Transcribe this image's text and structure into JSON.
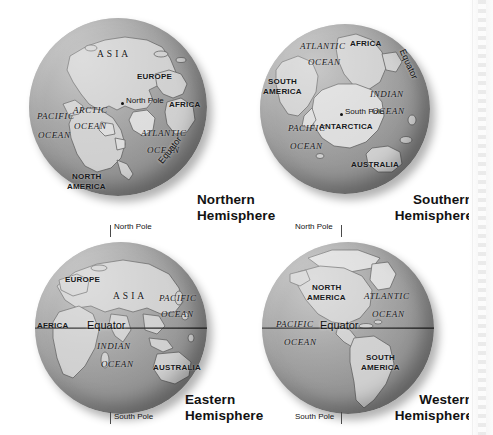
{
  "figure": {
    "background_color": "#ffffff",
    "ocean_color": "#949494",
    "land_color": "#cfcfcf",
    "line_color": "#1d1d1d",
    "panel_count": 4
  },
  "panels": [
    {
      "id": "northern",
      "caption_line1": "Northern",
      "caption_line2": "Hemisphere",
      "view": "north-polar",
      "pole_marker": {
        "label": "North Pole",
        "visible": true
      },
      "equator_label": "Equator",
      "labels": [
        {
          "text": "ASIA",
          "type": "continent-serif"
        },
        {
          "text": "EUROPE",
          "type": "continent"
        },
        {
          "text": "AFRICA",
          "type": "continent"
        },
        {
          "text": "NORTH",
          "type": "continent"
        },
        {
          "text": "AMERICA",
          "type": "continent"
        },
        {
          "text": "ARCTIC",
          "type": "ocean"
        },
        {
          "text": "OCEAN",
          "type": "ocean"
        },
        {
          "text": "PACIFIC",
          "type": "ocean"
        },
        {
          "text": "OCEAN",
          "type": "ocean"
        },
        {
          "text": "ATLANTIC",
          "type": "ocean"
        },
        {
          "text": "OCEAN",
          "type": "ocean"
        }
      ]
    },
    {
      "id": "southern",
      "caption_line1": "Southern",
      "caption_line2": "Hemisphere",
      "view": "south-polar",
      "pole_marker": {
        "label": "South Pole",
        "visible": true
      },
      "equator_label": "Equator",
      "labels": [
        {
          "text": "AFRICA",
          "type": "continent"
        },
        {
          "text": "SOUTH",
          "type": "continent"
        },
        {
          "text": "AMERICA",
          "type": "continent"
        },
        {
          "text": "ANTARCTICA",
          "type": "continent"
        },
        {
          "text": "AUSTRALIA",
          "type": "continent"
        },
        {
          "text": "ATLANTIC",
          "type": "ocean"
        },
        {
          "text": "OCEAN",
          "type": "ocean"
        },
        {
          "text": "INDIAN",
          "type": "ocean"
        },
        {
          "text": "OCEAN",
          "type": "ocean"
        },
        {
          "text": "PACIFIC",
          "type": "ocean"
        },
        {
          "text": "OCEAN",
          "type": "ocean"
        }
      ]
    },
    {
      "id": "eastern",
      "caption_line1": "Eastern",
      "caption_line2": "Hemisphere",
      "view": "equatorial-east",
      "north_pole_label": "North Pole",
      "south_pole_label": "South Pole",
      "equator_label": "Equator",
      "labels": [
        {
          "text": "EUROPE",
          "type": "continent"
        },
        {
          "text": "ASIA",
          "type": "continent-serif"
        },
        {
          "text": "AFRICA",
          "type": "continent"
        },
        {
          "text": "AUSTRALIA",
          "type": "continent"
        },
        {
          "text": "PACIFIC",
          "type": "ocean"
        },
        {
          "text": "OCEAN",
          "type": "ocean"
        },
        {
          "text": "INDIAN",
          "type": "ocean"
        },
        {
          "text": "OCEAN",
          "type": "ocean"
        }
      ]
    },
    {
      "id": "western",
      "caption_line1": "Western",
      "caption_line2": "Hemisphere",
      "view": "equatorial-west",
      "north_pole_label": "North Pole",
      "south_pole_label": "South Pole",
      "equator_label": "Equator",
      "labels": [
        {
          "text": "NORTH",
          "type": "continent"
        },
        {
          "text": "AMERICA",
          "type": "continent"
        },
        {
          "text": "SOUTH",
          "type": "continent"
        },
        {
          "text": "AMERICA",
          "type": "continent"
        },
        {
          "text": "ATLANTIC",
          "type": "ocean"
        },
        {
          "text": "OCEAN",
          "type": "ocean"
        },
        {
          "text": "PACIFIC",
          "type": "ocean"
        },
        {
          "text": "OCEAN",
          "type": "ocean"
        }
      ]
    }
  ]
}
